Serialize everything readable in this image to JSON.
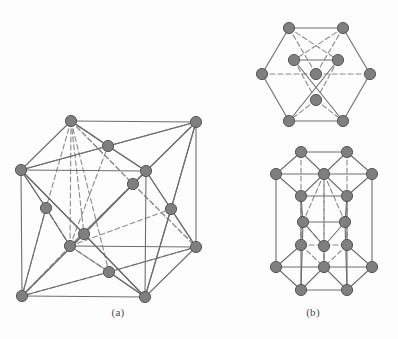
{
  "figure": {
    "background_color": "#fdfdfd",
    "atom_fill": "#7f7f7f",
    "atom_stroke": "#4d4d4d",
    "atom_radius": 5.6,
    "solid_edge_color": "#6e6e6e",
    "dashed_edge_color": "#8a8a8a",
    "edge_width": 1.1,
    "dash_pattern": "5,3"
  },
  "panels": [
    {
      "id": "panel-a",
      "caption": "(a)",
      "structure": "face-centered-cubic",
      "caption_x": 118,
      "caption_y": 312
    },
    {
      "id": "panel-b",
      "caption": "(b)",
      "structure": "hexagonal-close-packed",
      "caption_x": 313,
      "caption_y": 312
    }
  ],
  "fcc": {
    "name": "fcc-unit-cell",
    "atoms": [
      {
        "id": "c-tbl",
        "x": 71,
        "y": 121,
        "kind": "corner"
      },
      {
        "id": "c-tbr",
        "x": 196,
        "y": 122,
        "kind": "corner"
      },
      {
        "id": "c-tfl",
        "x": 21,
        "y": 170,
        "kind": "corner"
      },
      {
        "id": "c-tfr",
        "x": 146,
        "y": 171,
        "kind": "corner"
      },
      {
        "id": "c-bbl",
        "x": 70,
        "y": 246,
        "kind": "corner"
      },
      {
        "id": "c-bbr",
        "x": 196,
        "y": 247,
        "kind": "corner"
      },
      {
        "id": "c-bfl",
        "x": 22,
        "y": 296,
        "kind": "corner"
      },
      {
        "id": "c-bfr",
        "x": 145,
        "y": 297,
        "kind": "corner"
      },
      {
        "id": "f-top",
        "x": 108,
        "y": 146,
        "kind": "face-center"
      },
      {
        "id": "f-back",
        "x": 133,
        "y": 184,
        "kind": "face-center"
      },
      {
        "id": "f-left",
        "x": 46,
        "y": 208,
        "kind": "face-center"
      },
      {
        "id": "f-right",
        "x": 171,
        "y": 209,
        "kind": "face-center"
      },
      {
        "id": "f-front",
        "x": 84,
        "y": 234,
        "kind": "face-center"
      },
      {
        "id": "f-bottom",
        "x": 109,
        "y": 272,
        "kind": "face-center"
      }
    ],
    "solid_edges": [
      [
        "c-tbl",
        "c-tbr"
      ],
      [
        "c-tfl",
        "c-tfr"
      ],
      [
        "c-tbl",
        "c-tfl"
      ],
      [
        "c-tbr",
        "c-tfr"
      ],
      [
        "c-bfl",
        "c-bfr"
      ],
      [
        "c-bfl",
        "c-tfl"
      ],
      [
        "c-bfr",
        "c-tfr"
      ],
      [
        "c-bbr",
        "c-tbr"
      ],
      [
        "c-bbr",
        "c-bfr"
      ],
      [
        "c-bbl",
        "c-bbr"
      ]
    ],
    "dashed_edges": [
      [
        "c-bbl",
        "c-bfl"
      ],
      [
        "c-bbl",
        "c-tbl"
      ]
    ],
    "solid_triangles": [
      [
        "c-tbl",
        "f-top",
        "c-tbr"
      ],
      [
        "c-tbl",
        "f-top",
        "c-tfl"
      ],
      [
        "c-tbr",
        "f-top",
        "c-tfr"
      ],
      [
        "c-tfl",
        "f-top",
        "c-tfr"
      ],
      [
        "c-tfl",
        "f-left",
        "c-bfl"
      ],
      [
        "c-tfl",
        "f-left",
        "c-bbl"
      ],
      [
        "c-tbr",
        "f-right",
        "c-tfr"
      ],
      [
        "c-tfr",
        "f-right",
        "c-bfr"
      ],
      [
        "c-tbr",
        "f-right",
        "c-bbr"
      ],
      [
        "c-bfr",
        "f-right",
        "c-bbr"
      ],
      [
        "c-tfl",
        "f-front",
        "c-tfr"
      ],
      [
        "c-tfl",
        "f-front",
        "c-bfl"
      ],
      [
        "c-tfr",
        "f-front",
        "c-bfr"
      ],
      [
        "c-bfl",
        "f-front",
        "c-bfr"
      ],
      [
        "c-bfl",
        "f-bottom",
        "c-bfr"
      ],
      [
        "c-bbr",
        "f-bottom",
        "c-bfr"
      ]
    ],
    "dashed_triangles": [
      [
        "c-tbl",
        "f-back",
        "c-tbr"
      ],
      [
        "c-tbl",
        "f-back",
        "c-bbl"
      ],
      [
        "c-tbr",
        "f-back",
        "c-bbr"
      ],
      [
        "c-bbl",
        "f-back",
        "c-bbr"
      ],
      [
        "c-tbl",
        "f-left",
        "c-bbl"
      ],
      [
        "c-bbl",
        "f-left",
        "c-bfl"
      ],
      [
        "c-tbl",
        "f-front",
        "c-bbl"
      ],
      [
        "c-bbl",
        "f-bottom",
        "c-bfl"
      ],
      [
        "c-bbl",
        "f-bottom",
        "c-bbr"
      ],
      [
        "c-tbl",
        "f-bottom",
        "c-bbl"
      ],
      [
        "c-bbl",
        "f-right",
        "c-bbr"
      ],
      [
        "c-bbl",
        "f-top",
        "c-tbl"
      ]
    ]
  },
  "hcp_top": {
    "name": "hcp-basal-plane-top-view",
    "atoms": [
      {
        "id": "h-ul",
        "x": 289,
        "y": 28,
        "kind": "corner"
      },
      {
        "id": "h-ur",
        "x": 343,
        "y": 28,
        "kind": "corner"
      },
      {
        "id": "h-r",
        "x": 370,
        "y": 74,
        "kind": "corner"
      },
      {
        "id": "h-lr",
        "x": 343,
        "y": 121,
        "kind": "corner"
      },
      {
        "id": "h-ll",
        "x": 289,
        "y": 121,
        "kind": "corner"
      },
      {
        "id": "h-l",
        "x": 262,
        "y": 74,
        "kind": "corner"
      },
      {
        "id": "h-c",
        "x": 316,
        "y": 74,
        "kind": "center"
      },
      {
        "id": "h-il",
        "x": 294,
        "y": 60,
        "kind": "interior"
      },
      {
        "id": "h-ir",
        "x": 338,
        "y": 60,
        "kind": "interior"
      },
      {
        "id": "h-ib",
        "x": 316,
        "y": 100,
        "kind": "interior"
      }
    ],
    "solid_edges": [
      [
        "h-ul",
        "h-ur"
      ],
      [
        "h-ur",
        "h-r"
      ],
      [
        "h-r",
        "h-lr"
      ],
      [
        "h-lr",
        "h-ll"
      ],
      [
        "h-ll",
        "h-l"
      ],
      [
        "h-l",
        "h-ul"
      ],
      [
        "h-il",
        "h-ir"
      ],
      [
        "h-il",
        "h-lr"
      ],
      [
        "h-ir",
        "h-ll"
      ]
    ],
    "dashed_edges": [
      [
        "h-l",
        "h-c"
      ],
      [
        "h-c",
        "h-r"
      ],
      [
        "h-ul",
        "h-c"
      ],
      [
        "h-ur",
        "h-c"
      ],
      [
        "h-il",
        "h-ib"
      ],
      [
        "h-ir",
        "h-ib"
      ],
      [
        "h-ul",
        "h-ir"
      ],
      [
        "h-ur",
        "h-il"
      ],
      [
        "h-ib",
        "h-ll"
      ],
      [
        "h-ib",
        "h-lr"
      ]
    ]
  },
  "hcp_cell": {
    "name": "hcp-unit-cell-3d",
    "atoms": [
      {
        "id": "t-ul",
        "x": 301,
        "y": 152,
        "kind": "top-corner"
      },
      {
        "id": "t-ur",
        "x": 347,
        "y": 152,
        "kind": "top-corner"
      },
      {
        "id": "t-r",
        "x": 372,
        "y": 174,
        "kind": "top-corner"
      },
      {
        "id": "t-lr",
        "x": 347,
        "y": 196,
        "kind": "top-corner"
      },
      {
        "id": "t-ll",
        "x": 301,
        "y": 196,
        "kind": "top-corner"
      },
      {
        "id": "t-l",
        "x": 276,
        "y": 174,
        "kind": "top-corner"
      },
      {
        "id": "t-c",
        "x": 324,
        "y": 174,
        "kind": "top-center"
      },
      {
        "id": "m-l",
        "x": 303,
        "y": 222,
        "kind": "mid-plane"
      },
      {
        "id": "m-r",
        "x": 345,
        "y": 222,
        "kind": "mid-plane"
      },
      {
        "id": "m-b",
        "x": 324,
        "y": 246,
        "kind": "mid-plane"
      },
      {
        "id": "b-ul",
        "x": 301,
        "y": 245,
        "kind": "bottom-corner"
      },
      {
        "id": "b-ur",
        "x": 347,
        "y": 245,
        "kind": "bottom-corner"
      },
      {
        "id": "b-r",
        "x": 372,
        "y": 267,
        "kind": "bottom-corner"
      },
      {
        "id": "b-lr",
        "x": 347,
        "y": 290,
        "kind": "bottom-corner"
      },
      {
        "id": "b-ll",
        "x": 301,
        "y": 290,
        "kind": "bottom-corner"
      },
      {
        "id": "b-l",
        "x": 276,
        "y": 267,
        "kind": "bottom-corner"
      },
      {
        "id": "b-c",
        "x": 324,
        "y": 267,
        "kind": "bottom-center"
      }
    ],
    "solid_edges": [
      [
        "t-ul",
        "t-ur"
      ],
      [
        "t-ur",
        "t-r"
      ],
      [
        "t-r",
        "t-lr"
      ],
      [
        "t-lr",
        "t-ll"
      ],
      [
        "t-ll",
        "t-l"
      ],
      [
        "t-l",
        "t-ul"
      ],
      [
        "t-l",
        "t-c"
      ],
      [
        "t-c",
        "t-r"
      ],
      [
        "t-ul",
        "t-c"
      ],
      [
        "t-ur",
        "t-c"
      ],
      [
        "t-ll",
        "t-c"
      ],
      [
        "t-lr",
        "t-c"
      ],
      [
        "b-ur",
        "b-r"
      ],
      [
        "b-r",
        "b-lr"
      ],
      [
        "b-lr",
        "b-ll"
      ],
      [
        "b-ll",
        "b-l"
      ],
      [
        "b-l",
        "b-ul"
      ],
      [
        "b-l",
        "b-c"
      ],
      [
        "b-c",
        "b-r"
      ],
      [
        "b-ll",
        "b-c"
      ],
      [
        "b-lr",
        "b-c"
      ],
      [
        "t-l",
        "b-l"
      ],
      [
        "t-r",
        "b-r"
      ],
      [
        "t-ll",
        "b-ll"
      ],
      [
        "t-lr",
        "b-lr"
      ],
      [
        "m-l",
        "m-r"
      ],
      [
        "m-l",
        "m-b"
      ],
      [
        "m-r",
        "m-b"
      ],
      [
        "t-ll",
        "m-l"
      ],
      [
        "t-lr",
        "m-r"
      ],
      [
        "m-l",
        "b-ll"
      ],
      [
        "m-r",
        "b-lr"
      ],
      [
        "m-b",
        "b-c"
      ]
    ],
    "dashed_edges": [
      [
        "b-ul",
        "b-ur"
      ],
      [
        "b-ul",
        "b-c"
      ],
      [
        "b-ur",
        "b-c"
      ],
      [
        "t-ul",
        "b-ul"
      ],
      [
        "t-ur",
        "b-ur"
      ],
      [
        "t-c",
        "b-c"
      ],
      [
        "m-l",
        "m-b"
      ],
      [
        "t-c",
        "m-l"
      ],
      [
        "t-c",
        "m-r"
      ],
      [
        "m-b",
        "t-c"
      ]
    ]
  }
}
